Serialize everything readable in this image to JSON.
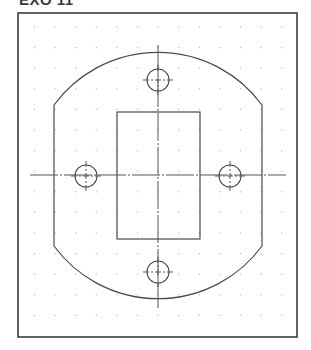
{
  "title": "EXO 11",
  "colors": {
    "frame": "#3c3c3c",
    "outline": "#4a4a4a",
    "centerline": "#555555",
    "grid_dot": "#b8b8b8",
    "background": "#ffffff"
  },
  "drawing": {
    "frame": {
      "x": 18,
      "y": 13,
      "width": 279,
      "height": 324
    },
    "grid": {
      "x0": 34.5,
      "y0": 27,
      "step": 20.6,
      "cols": 13,
      "rows": 15
    },
    "center": {
      "x": 158,
      "y": 175
    },
    "outline": {
      "description": "Plate with circular top/bottom arcs and straight vertical sides",
      "left_side_x": 54,
      "right_side_x": 262,
      "side_top_y": 105,
      "side_bottom_y": 246,
      "arc_top_y": 46,
      "arc_bottom_y": 302
    },
    "rectangle_cutout": {
      "x": 117,
      "y": 112,
      "width": 83,
      "height": 127
    },
    "holes": [
      {
        "name": "top",
        "cx": 158,
        "cy": 80,
        "r": 11
      },
      {
        "name": "bottom",
        "cx": 158,
        "cy": 272,
        "r": 11
      },
      {
        "name": "left",
        "cx": 86,
        "cy": 176,
        "r": 11
      },
      {
        "name": "right",
        "cx": 230,
        "cy": 176,
        "r": 11
      }
    ],
    "centerlines": {
      "horizontal": {
        "x1": 30,
        "x2": 286,
        "y": 175
      },
      "vertical": {
        "x": 158,
        "y1": 45,
        "y2": 308
      }
    }
  }
}
